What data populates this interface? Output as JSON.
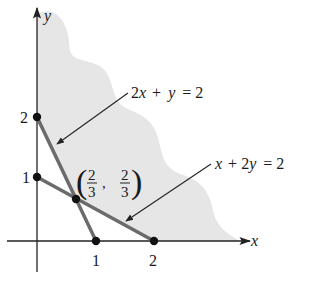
{
  "figure": {
    "axes": {
      "x_label": "x",
      "y_label": "y",
      "x_ticks": [
        "1",
        "2"
      ],
      "y_ticks": [
        "1",
        "2"
      ]
    },
    "lines": [
      {
        "equation": "2x + y = 2",
        "label_parts": [
          "2",
          "x",
          " + ",
          "y",
          " = 2"
        ],
        "from": [
          0,
          2
        ],
        "to": [
          1,
          0
        ]
      },
      {
        "equation": "x + 2y = 2",
        "label_parts": [
          "x",
          " + 2",
          "y",
          " = 2"
        ],
        "from": [
          0,
          1
        ],
        "to": [
          2,
          0
        ]
      }
    ],
    "points": [
      {
        "name": "y-intercept-2x+y",
        "coords": [
          0,
          2
        ]
      },
      {
        "name": "y-intercept-x+2y",
        "coords": [
          0,
          1
        ]
      },
      {
        "name": "intersection",
        "coords": [
          0.6667,
          0.6667
        ],
        "label": {
          "x_num": "2",
          "x_den": "3",
          "y_num": "2",
          "y_den": "3",
          "open": "(",
          "close": ")",
          "comma": ","
        }
      },
      {
        "name": "x-intercept-2x+y",
        "coords": [
          1,
          0
        ]
      },
      {
        "name": "x-intercept-x+2y",
        "coords": [
          2,
          0
        ]
      }
    ],
    "colors": {
      "region_fill": "#e6e6e6",
      "constraint_line": "#6b6b6b",
      "axis": "#222222",
      "point": "#111111"
    }
  }
}
